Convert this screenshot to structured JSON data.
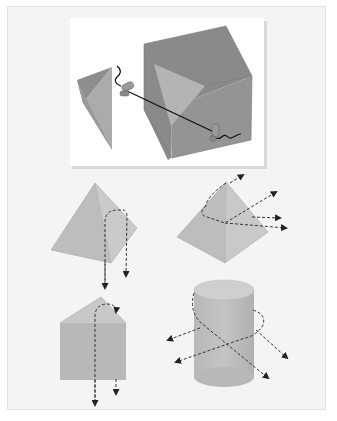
{
  "figure": {
    "top_illustration": {
      "label": "cube-cut-with-wire-saw",
      "parts": [
        "cube",
        "cut-off-tetrahedron",
        "wire-saw",
        "handle-left",
        "handle-right"
      ]
    },
    "shapes": [
      {
        "label": "square-pyramid-vertical-cut",
        "arrows": 2
      },
      {
        "label": "square-pyramid-diagonal-cut",
        "arrows": 4
      },
      {
        "label": "triangular-prism-vertical-cut",
        "arrows": 2
      },
      {
        "label": "cylinder-diagonal-cut",
        "arrows": 4
      }
    ],
    "colors": {
      "panel_bg": "#f4f4f4",
      "inset_bg": "#ffffff",
      "cube_dark": "#8a8a8a",
      "cube_mid": "#9a9a9a",
      "cut_face": "#b4b4b4",
      "shape_fill_light": "#c4c4c4",
      "shape_fill_dark": "#b2b2b2",
      "arrow": "#333333"
    }
  }
}
